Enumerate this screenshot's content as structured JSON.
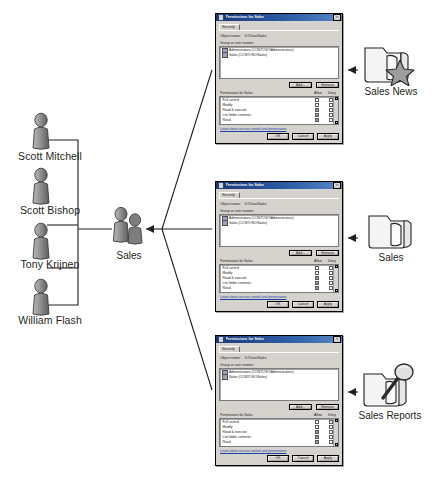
{
  "diagram": {
    "people": [
      {
        "name": "Scott Mitchell",
        "icon": "user-icon"
      },
      {
        "name": "Scott Bishop",
        "icon": "user-icon"
      },
      {
        "name": "Tony Krijnen",
        "icon": "user-icon"
      },
      {
        "name": "William Flash",
        "icon": "user-icon"
      }
    ],
    "group": {
      "label": "Sales",
      "icon": "user-group-icon"
    },
    "folders": [
      {
        "label": "Sales News",
        "icon": "folder-star-icon"
      },
      {
        "label": "Sales",
        "icon": "folder-icon"
      },
      {
        "label": "Sales Reports",
        "icon": "folder-search-icon"
      }
    ]
  },
  "dialog": {
    "title": "Permissions for Sales",
    "title_icon": "shield-icon",
    "close_label": "×",
    "tabs": [
      {
        "label": "Security"
      }
    ],
    "object_name_label": "Object name:",
    "object_name_value": "D:\\Data\\Sales",
    "group_list_label": "Group or user names:",
    "group_list": [
      {
        "icon": "users-icon",
        "label": "Administrators (CONTOSO\\Administrators)"
      },
      {
        "icon": "users-icon",
        "label": "Sales (CONTOSO\\Sales)"
      }
    ],
    "add_label": "Add...",
    "remove_label": "Remove",
    "permissions_label": "Permissions for Sales",
    "allow_label": "Allow",
    "deny_label": "Deny",
    "permissions": [
      {
        "name": "Full control",
        "allow": false,
        "deny": false
      },
      {
        "name": "Modify",
        "allow": false,
        "deny": false
      },
      {
        "name": "Read & execute",
        "allow": true,
        "deny": false
      },
      {
        "name": "List folder contents",
        "allow": true,
        "deny": false
      },
      {
        "name": "Read",
        "allow": true,
        "deny": false
      }
    ],
    "scroll_up": "▴",
    "scroll_down": "▾",
    "help_link": "Learn about access control and permissions",
    "ok_label": "OK",
    "cancel_label": "Cancel",
    "apply_label": "Apply"
  },
  "colors": {
    "titlebar_start": "#1a3a78",
    "titlebar_end": "#5a86c4",
    "dialog_face": "#d6d3ce",
    "link": "#1b3fa0",
    "line": "#231f20",
    "text": "#231f20"
  }
}
